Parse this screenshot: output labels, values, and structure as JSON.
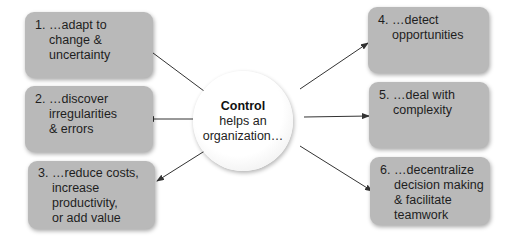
{
  "center": {
    "title": "Control",
    "line2": "helps an",
    "line3": "organization…"
  },
  "boxes": [
    {
      "number": "1.",
      "lines": [
        "…adapt to",
        "change &",
        "uncertainty"
      ]
    },
    {
      "number": "2.",
      "lines": [
        "…discover",
        "irregularities",
        "& errors"
      ]
    },
    {
      "number": "3.",
      "lines": [
        "…reduce costs,",
        "increase",
        "productivity,",
        "or add value"
      ]
    },
    {
      "number": "4.",
      "lines": [
        "…detect",
        "opportunities"
      ]
    },
    {
      "number": "5.",
      "lines": [
        "…deal with",
        "complexity"
      ]
    },
    {
      "number": "6.",
      "lines": [
        "…decentralize",
        "decision making",
        "& facilitate",
        "teamwork"
      ]
    }
  ],
  "colors": {
    "box_fill": "#b9b9b9",
    "arrow": "#333333",
    "circle_fill": "#ffffff"
  }
}
